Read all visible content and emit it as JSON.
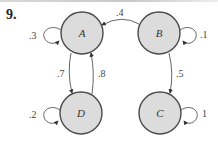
{
  "problem": {
    "number": "9."
  },
  "colors": {
    "node_fill": "#dcdcdc",
    "node_stroke": "#4a4a4a",
    "edge_stroke": "#555555"
  },
  "nodes": [
    {
      "id": "A",
      "label": "A",
      "cx": 82,
      "cy": 33,
      "r": 21
    },
    {
      "id": "B",
      "label": "B",
      "cx": 159,
      "cy": 33,
      "r": 21
    },
    {
      "id": "C",
      "label": "C",
      "cx": 160,
      "cy": 113,
      "r": 21
    },
    {
      "id": "D",
      "label": "D",
      "cx": 81,
      "cy": 113,
      "r": 21
    }
  ],
  "edges": [
    {
      "from": "A",
      "to": "A",
      "weight": ".3",
      "type": "self-loop",
      "side": "left"
    },
    {
      "from": "B",
      "to": "A",
      "weight": ".4",
      "type": "arc"
    },
    {
      "from": "B",
      "to": "B",
      "weight": ".1",
      "type": "self-loop",
      "side": "right"
    },
    {
      "from": "A",
      "to": "D",
      "weight": ".7",
      "type": "arc"
    },
    {
      "from": "D",
      "to": "A",
      "weight": ".8",
      "type": "arc"
    },
    {
      "from": "B",
      "to": "C",
      "weight": ".5",
      "type": "arc"
    },
    {
      "from": "D",
      "to": "D",
      "weight": ".2",
      "type": "self-loop",
      "side": "left"
    },
    {
      "from": "C",
      "to": "C",
      "weight": "1",
      "type": "self-loop",
      "side": "right"
    }
  ]
}
